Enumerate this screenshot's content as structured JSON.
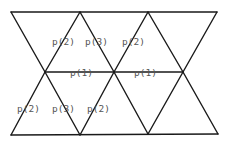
{
  "diagram": {
    "line_color": "#1a1a1a",
    "label_color": "#555555",
    "vertices": {
      "top": [
        [
          11,
          12
        ],
        [
          80,
          12
        ],
        [
          148,
          12
        ],
        [
          217,
          12
        ]
      ],
      "middle": [
        [
          45,
          72
        ],
        [
          114,
          72
        ],
        [
          183,
          72
        ]
      ],
      "bottom": [
        [
          11,
          135
        ],
        [
          80,
          135
        ],
        [
          148,
          134
        ],
        [
          218,
          134
        ]
      ]
    },
    "labels": [
      {
        "text": "p(2)",
        "x": 52,
        "y": 42
      },
      {
        "text": "p(3)",
        "x": 85,
        "y": 42
      },
      {
        "text": "p(2)",
        "x": 122,
        "y": 42
      },
      {
        "text": "p(1)",
        "x": 70,
        "y": 76
      },
      {
        "text": "p(1)",
        "x": 134,
        "y": 76
      },
      {
        "text": "p(2)",
        "x": 17,
        "y": 111
      },
      {
        "text": "p(3)",
        "x": 52,
        "y": 111
      },
      {
        "text": "p(2)",
        "x": 87,
        "y": 111
      }
    ]
  }
}
